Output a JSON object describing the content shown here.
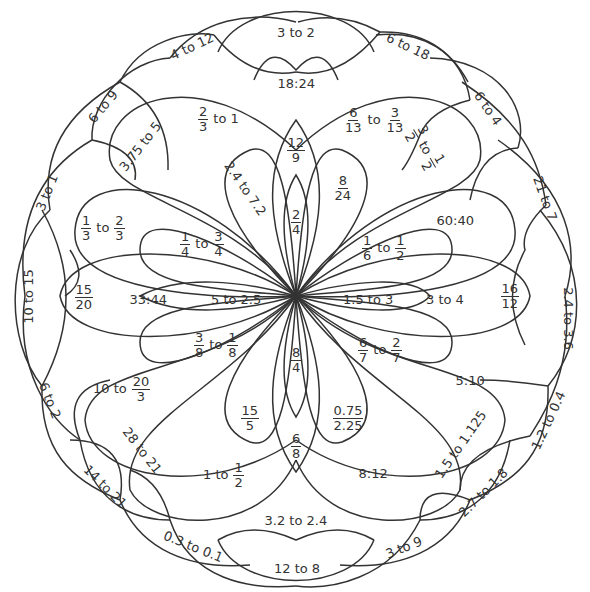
{
  "worksheet": {
    "type": "ratio-mandala",
    "line_color": "#333333",
    "background": "#ffffff"
  },
  "labels": {
    "outer": [
      {
        "id": "o1",
        "text": "3 to 2",
        "x": 296,
        "y": 32,
        "rot": 0
      },
      {
        "id": "o2",
        "text": "6 to 18",
        "x": 408,
        "y": 46,
        "rot": 25
      },
      {
        "id": "o3",
        "text": "6 to 4",
        "x": 488,
        "y": 108,
        "rot": 55
      },
      {
        "id": "o4",
        "text": "21 to 7",
        "x": 545,
        "y": 198,
        "rot": 70
      },
      {
        "id": "o5",
        "text": "2.4 to 3.6",
        "x": 568,
        "y": 318,
        "rot": 90
      },
      {
        "id": "o6",
        "text": "1.2 to 0.4",
        "x": 548,
        "y": 420,
        "rot": -65
      },
      {
        "id": "o7",
        "text": "2.7 to 1.8",
        "x": 483,
        "y": 492,
        "rot": -45
      },
      {
        "id": "o8",
        "text": "3 to 9",
        "x": 404,
        "y": 547,
        "rot": -22
      },
      {
        "id": "o9",
        "text": "12 to 8",
        "x": 297,
        "y": 568,
        "rot": 0
      },
      {
        "id": "o10",
        "text": "0.3 to 0.1",
        "x": 193,
        "y": 546,
        "rot": 22
      },
      {
        "id": "o11",
        "text": "14 to 21",
        "x": 105,
        "y": 486,
        "rot": 45
      },
      {
        "id": "o12",
        "text": "6 to 2",
        "x": 50,
        "y": 400,
        "rot": 68
      },
      {
        "id": "o13",
        "text": "10 to 15",
        "x": 28,
        "y": 296,
        "rot": -90
      },
      {
        "id": "o14",
        "text": "3 to 1",
        "x": 47,
        "y": 192,
        "rot": -68
      },
      {
        "id": "o15",
        "text": "6 to 9",
        "x": 103,
        "y": 106,
        "rot": -50
      },
      {
        "id": "o16",
        "text": "4 to 12",
        "x": 192,
        "y": 46,
        "rot": -25
      }
    ],
    "middle": [
      {
        "id": "m1",
        "text": "18:24",
        "x": 296,
        "y": 83,
        "rot": 0
      },
      {
        "id": "m2",
        "parts": [
          {
            "num": "3",
            "den": "2"
          },
          {
            "sep": "to"
          },
          {
            "num": "1",
            "den": "2"
          }
        ],
        "x": 425,
        "y": 148,
        "rot": 60
      },
      {
        "id": "m3",
        "parts": [
          {
            "num": "16",
            "den": "12"
          }
        ],
        "x": 510,
        "y": 296,
        "rot": 0
      },
      {
        "id": "m4",
        "text": "1.5 to 1.125",
        "x": 460,
        "y": 444,
        "rot": -55
      },
      {
        "id": "m5",
        "text": "3.2 to 2.4",
        "x": 296,
        "y": 520,
        "rot": 0
      },
      {
        "id": "m6",
        "text": "28 to 21",
        "x": 142,
        "y": 450,
        "rot": 52
      },
      {
        "id": "m7",
        "parts": [
          {
            "num": "15",
            "den": "20"
          }
        ],
        "x": 84,
        "y": 297,
        "rot": 0
      },
      {
        "id": "m8",
        "text": "3.75 to 5",
        "x": 140,
        "y": 146,
        "rot": -52
      }
    ],
    "large_petals": [
      {
        "id": "p1",
        "parts": [
          {
            "num": "2",
            "den": "3"
          },
          {
            "sep": "to 1"
          }
        ],
        "x": 220,
        "y": 119,
        "rot": 0
      },
      {
        "id": "p2",
        "parts": [
          {
            "num": "6",
            "den": "13"
          },
          {
            "sep": "to"
          },
          {
            "num": "3",
            "den": "13"
          }
        ],
        "x": 374,
        "y": 120,
        "rot": 0
      },
      {
        "id": "p3",
        "text": "60:40",
        "x": 455,
        "y": 220,
        "rot": 0
      },
      {
        "id": "p4",
        "text": "5:10",
        "x": 470,
        "y": 380,
        "rot": 0
      },
      {
        "id": "p5",
        "text": "8:12",
        "x": 373,
        "y": 473,
        "rot": 0
      },
      {
        "id": "p6",
        "parts": [
          {
            "sep": "1 to"
          },
          {
            "num": "1",
            "den": "2"
          }
        ],
        "x": 222,
        "y": 475,
        "rot": 0
      },
      {
        "id": "p7",
        "parts": [
          {
            "sep": "10 to"
          },
          {
            "num": "20",
            "den": "3"
          }
        ],
        "x": 120,
        "y": 389,
        "rot": 0
      },
      {
        "id": "p8",
        "parts": [
          {
            "num": "1",
            "den": "3"
          },
          {
            "sep": "to"
          },
          {
            "num": "2",
            "den": "3"
          }
        ],
        "x": 103,
        "y": 228,
        "rot": 0
      }
    ],
    "inner_petals": [
      {
        "id": "i1",
        "text": "2.4 to 7.2",
        "x": 245,
        "y": 188,
        "rot": 55
      },
      {
        "id": "i2",
        "parts": [
          {
            "num": "8",
            "den": "24"
          }
        ],
        "x": 343,
        "y": 188,
        "rot": 0
      },
      {
        "id": "i3",
        "parts": [
          {
            "num": "1",
            "den": "6"
          },
          {
            "sep": "to"
          },
          {
            "num": "1",
            "den": "2"
          }
        ],
        "x": 384,
        "y": 248,
        "rot": 0
      },
      {
        "id": "i4",
        "parts": [
          {
            "num": "6",
            "den": "7"
          },
          {
            "sep": "to"
          },
          {
            "num": "2",
            "den": "7"
          }
        ],
        "x": 380,
        "y": 350,
        "rot": 0
      },
      {
        "id": "i5",
        "parts": [
          {
            "num": "0.75",
            "den": "2.25"
          }
        ],
        "x": 348,
        "y": 418,
        "rot": 0
      },
      {
        "id": "i6",
        "parts": [
          {
            "num": "15",
            "den": "5"
          }
        ],
        "x": 250,
        "y": 418,
        "rot": 0
      },
      {
        "id": "i7",
        "parts": [
          {
            "num": "3",
            "den": "8"
          },
          {
            "sep": "to"
          },
          {
            "num": "1",
            "den": "8"
          }
        ],
        "x": 216,
        "y": 345,
        "rot": 0
      },
      {
        "id": "i8",
        "parts": [
          {
            "num": "1",
            "den": "4"
          },
          {
            "sep": "to"
          },
          {
            "num": "3",
            "den": "4"
          }
        ],
        "x": 202,
        "y": 244,
        "rot": 0
      }
    ],
    "center_spokes": [
      {
        "id": "s1",
        "parts": [
          {
            "num": "12",
            "den": "9"
          }
        ],
        "x": 296,
        "y": 150,
        "rot": 0
      },
      {
        "id": "s2",
        "parts": [
          {
            "num": "2",
            "den": "4"
          }
        ],
        "x": 296,
        "y": 222,
        "rot": 0
      },
      {
        "id": "s3",
        "text": "1.5 to 3",
        "x": 368,
        "y": 299,
        "rot": 0
      },
      {
        "id": "s4",
        "text": "3 to 4",
        "x": 445,
        "y": 299,
        "rot": 0
      },
      {
        "id": "s5",
        "parts": [
          {
            "num": "8",
            "den": "4"
          }
        ],
        "x": 296,
        "y": 360,
        "rot": 0
      },
      {
        "id": "s6",
        "parts": [
          {
            "num": "6",
            "den": "8"
          }
        ],
        "x": 296,
        "y": 446,
        "rot": 0
      },
      {
        "id": "s7",
        "text": "5 to 2.5",
        "x": 236,
        "y": 299,
        "rot": 0
      },
      {
        "id": "s8",
        "text": "33:44",
        "x": 148,
        "y": 299,
        "rot": 0
      }
    ]
  }
}
